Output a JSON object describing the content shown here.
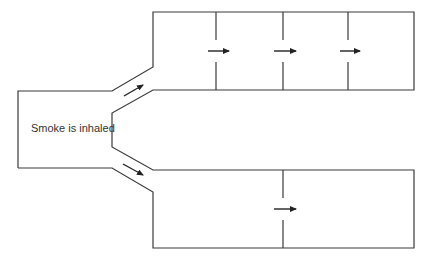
{
  "diagram": {
    "type": "airway-branching-flow",
    "label": "Smoke is inhaled",
    "colors": {
      "line": "#3a3a3a",
      "arrow": "#222222",
      "background": "#ffffff"
    },
    "regions": [
      {
        "name": "trachea-chamber",
        "description": "left entry chamber"
      },
      {
        "name": "upper-branch",
        "compartments": 4
      },
      {
        "name": "lower-branch",
        "compartments": 2
      }
    ],
    "arrows": [
      {
        "name": "upper-branch-entry",
        "direction": "up-right"
      },
      {
        "name": "lower-branch-entry",
        "direction": "down-right"
      },
      {
        "name": "upper-divider-1",
        "direction": "right"
      },
      {
        "name": "upper-divider-2",
        "direction": "right"
      },
      {
        "name": "upper-divider-3",
        "direction": "right"
      },
      {
        "name": "lower-divider-1",
        "direction": "right"
      }
    ]
  }
}
